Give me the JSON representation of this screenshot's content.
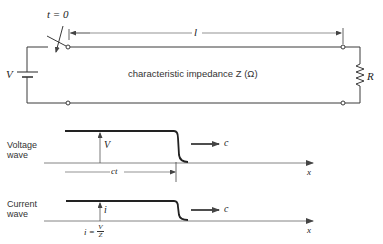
{
  "circuit": {
    "switch_label": "t = 0",
    "length_label": "l",
    "source_label": "V",
    "line_label": "characteristic impedance Z (Ω)",
    "load_label": "R"
  },
  "voltage_wave": {
    "title_line1": "Voltage",
    "title_line2": "wave",
    "amplitude_label": "V",
    "distance_label": "ct",
    "velocity_label": "c",
    "axis_label": "x"
  },
  "current_wave": {
    "title_line1": "Current",
    "title_line2": "wave",
    "amplitude_label": "i",
    "velocity_label": "c",
    "axis_label": "x",
    "relation_lhs": "i =",
    "relation_num": "V",
    "relation_den": "Z"
  },
  "colors": {
    "line": "#3a3a3a",
    "wave": "#222222",
    "axis": "#555555"
  }
}
